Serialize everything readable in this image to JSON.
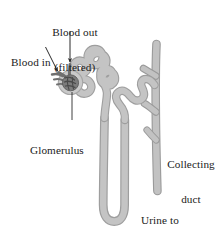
{
  "figure": {
    "background_color": "#ffffff",
    "tubule_color": "#bdbdbd",
    "tubule_edge_color": "#9a9a9a",
    "glomerulus_color": "#6e6e6e",
    "capsule_color": "#c9c9c9",
    "label_color": "#1a1a1a",
    "leader_color": "#3a3a3a"
  },
  "labels": {
    "blood_out_line1": "Blood out",
    "blood_out_line2": "(filtered)",
    "blood_in": "Blood in",
    "glomerulus": "Glomerulus",
    "collecting_duct_line1": "Collecting",
    "collecting_duct_line2": "duct",
    "urine_line1": "Urine to",
    "urine_line2": "ureter"
  },
  "structures": [
    {
      "name": "glomerulus",
      "description": "dark capillary knot inside Bowman's capsule"
    },
    {
      "name": "bowmans-capsule",
      "description": "light ring surrounding the glomerulus"
    },
    {
      "name": "afferent-arteriole",
      "description": "blood in vessel entering capsule"
    },
    {
      "name": "efferent-arteriole",
      "description": "blood out vessel leaving capsule"
    },
    {
      "name": "proximal-convoluted-tubule",
      "description": "winding tubule above the loop"
    },
    {
      "name": "loop-of-henle",
      "description": "long U-shaped descending and ascending limb"
    },
    {
      "name": "distal-convoluted-tubule",
      "description": "winding tubule joining the collecting duct"
    },
    {
      "name": "collecting-duct",
      "description": "vertical duct on the right with three tributary branches"
    }
  ],
  "leaders": [
    {
      "name": "blood-out-arrow",
      "type": "arrow",
      "from": [
        70,
        32
      ],
      "to": [
        70,
        63
      ]
    },
    {
      "name": "blood-in-arrow",
      "type": "arrow",
      "from": [
        46,
        47
      ],
      "to": [
        58,
        72
      ]
    },
    {
      "name": "glomerulus-leader",
      "type": "line",
      "from": [
        72,
        93
      ],
      "to": [
        72,
        120
      ]
    }
  ]
}
